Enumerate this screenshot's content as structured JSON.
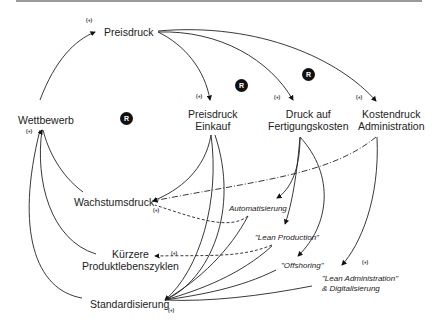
{
  "diagram": {
    "type": "causal-loop",
    "nodes": {
      "preisdruck": "Preisdruck",
      "wettbewerb": "Wettbewerb",
      "preisdruck_einkauf_1": "Preisdruck",
      "preisdruck_einkauf_2": "Einkauf",
      "druck_fertigung_1": "Druck auf",
      "druck_fertigung_2": "Fertigungskosten",
      "kostendruck_admin_1": "Kostendruck",
      "kostendruck_admin_2": "Administration",
      "wachstumsdruck": "Wachstumsdruck",
      "kuerzere_1": "Kürzere",
      "kuerzere_2": "Produktlebenszyklen",
      "standardisierung": "Standardisierung"
    },
    "levers": {
      "automatisierung": "Automatisierung",
      "lean_production": "\"Lean Production\"",
      "offshoring": "\"Offshoring\"",
      "lean_admin_1": "\"Lean Administration\"",
      "lean_admin_2": "& Digitalisierung"
    },
    "polarity_sign": "(+)",
    "loop_badge": "R",
    "edges": [
      {
        "from": "Wettbewerb",
        "to": "Preisdruck",
        "polarity": "+"
      },
      {
        "from": "Preisdruck",
        "to": "Preisdruck Einkauf",
        "polarity": "+"
      },
      {
        "from": "Preisdruck",
        "to": "Druck auf Fertigungskosten",
        "polarity": "+"
      },
      {
        "from": "Preisdruck",
        "to": "Kostendruck Administration",
        "polarity": "+"
      },
      {
        "from": "Preisdruck Einkauf",
        "to": "Wachstumsdruck",
        "polarity": "+"
      },
      {
        "from": "Kostendruck Administration",
        "to": "Wachstumsdruck",
        "polarity": "+",
        "style": "dash-dot"
      },
      {
        "from": "Wachstumsdruck",
        "to": "Wettbewerb",
        "polarity": "+"
      },
      {
        "from": "Kürzere Produktlebenszyklen",
        "to": "Wettbewerb",
        "polarity": "+"
      },
      {
        "from": "Standardisierung",
        "to": "Wettbewerb",
        "polarity": "+"
      },
      {
        "from": "Druck auf Fertigungskosten",
        "to": "Automatisierung"
      },
      {
        "from": "Druck auf Fertigungskosten",
        "to": "\"Lean Production\""
      },
      {
        "from": "Druck auf Fertigungskosten",
        "to": "\"Offshoring\""
      },
      {
        "from": "Kostendruck Administration",
        "to": "\"Lean Administration\" & Digitalisierung",
        "polarity": "+"
      },
      {
        "from": "Automatisierung",
        "to": "Wachstumsdruck",
        "style": "dashed"
      },
      {
        "from": "\"Lean Production\"",
        "to": "Kürzere Produktlebenszyklen",
        "polarity": "+",
        "style": "dashed"
      },
      {
        "from": "Preisdruck Einkauf",
        "to": "Standardisierung",
        "polarity": "+"
      },
      {
        "from": "Automatisierung",
        "to": "Standardisierung"
      },
      {
        "from": "\"Lean Production\"",
        "to": "Standardisierung"
      },
      {
        "from": "\"Offshoring\"",
        "to": "Standardisierung"
      },
      {
        "from": "\"Lean Administration\" & Digitalisierung",
        "to": "Standardisierung"
      }
    ]
  }
}
